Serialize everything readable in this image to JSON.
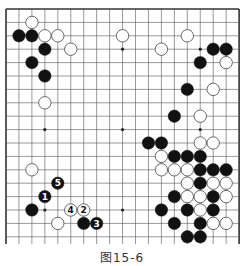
{
  "caption": "图15-6",
  "board": {
    "columns": 19,
    "rows_visible": 18,
    "origin_x": 6,
    "origin_y": 9,
    "spacing_x": 12.95,
    "spacing_y": 13.4,
    "edges": {
      "left": true,
      "top": true,
      "right": true,
      "bottom": false
    },
    "star_points": [
      [
        3,
        3
      ],
      [
        9,
        3
      ],
      [
        15,
        3
      ],
      [
        3,
        9
      ],
      [
        9,
        9
      ],
      [
        15,
        9
      ],
      [
        3,
        15
      ],
      [
        9,
        15
      ],
      [
        15,
        15
      ]
    ],
    "colors": {
      "line": "#555555",
      "edge": "#333333",
      "black": "#111111",
      "white": "#ffffff"
    }
  },
  "stones": [
    {
      "c": 2,
      "r": 1,
      "color": "white"
    },
    {
      "c": 1,
      "r": 2,
      "color": "black"
    },
    {
      "c": 2,
      "r": 2,
      "color": "black"
    },
    {
      "c": 3,
      "r": 2,
      "color": "white"
    },
    {
      "c": 4,
      "r": 2,
      "color": "white"
    },
    {
      "c": 9,
      "r": 2,
      "color": "white"
    },
    {
      "c": 14,
      "r": 2,
      "color": "white"
    },
    {
      "c": 3,
      "r": 3,
      "color": "black"
    },
    {
      "c": 5,
      "r": 3,
      "color": "white"
    },
    {
      "c": 12,
      "r": 3,
      "color": "white"
    },
    {
      "c": 16,
      "r": 3,
      "color": "black"
    },
    {
      "c": 17,
      "r": 3,
      "color": "black"
    },
    {
      "c": 2,
      "r": 4,
      "color": "black"
    },
    {
      "c": 15,
      "r": 4,
      "color": "black"
    },
    {
      "c": 17,
      "r": 4,
      "color": "white"
    },
    {
      "c": 3,
      "r": 5,
      "color": "black"
    },
    {
      "c": 14,
      "r": 6,
      "color": "black"
    },
    {
      "c": 16,
      "r": 6,
      "color": "white"
    },
    {
      "c": 3,
      "r": 7,
      "color": "white"
    },
    {
      "c": 13,
      "r": 8,
      "color": "black"
    },
    {
      "c": 15,
      "r": 8,
      "color": "white"
    },
    {
      "c": 11,
      "r": 10,
      "color": "black"
    },
    {
      "c": 12,
      "r": 10,
      "color": "black"
    },
    {
      "c": 15,
      "r": 10,
      "color": "white"
    },
    {
      "c": 16,
      "r": 10,
      "color": "white"
    },
    {
      "c": 12,
      "r": 11,
      "color": "white"
    },
    {
      "c": 13,
      "r": 11,
      "color": "black"
    },
    {
      "c": 14,
      "r": 11,
      "color": "black"
    },
    {
      "c": 15,
      "r": 11,
      "color": "black"
    },
    {
      "c": 12,
      "r": 12,
      "color": "white"
    },
    {
      "c": 13,
      "r": 12,
      "color": "white"
    },
    {
      "c": 14,
      "r": 12,
      "color": "white"
    },
    {
      "c": 15,
      "r": 12,
      "color": "black"
    },
    {
      "c": 16,
      "r": 12,
      "color": "black"
    },
    {
      "c": 17,
      "r": 12,
      "color": "black"
    },
    {
      "c": 2,
      "r": 12,
      "color": "white"
    },
    {
      "c": 14,
      "r": 13,
      "color": "white"
    },
    {
      "c": 15,
      "r": 13,
      "color": "black"
    },
    {
      "c": 16,
      "r": 13,
      "color": "white"
    },
    {
      "c": 17,
      "r": 13,
      "color": "white"
    },
    {
      "c": 4,
      "r": 13,
      "color": "black",
      "label": "5"
    },
    {
      "c": 3,
      "r": 14,
      "color": "black",
      "label": "1"
    },
    {
      "c": 13,
      "r": 14,
      "color": "black"
    },
    {
      "c": 14,
      "r": 14,
      "color": "white"
    },
    {
      "c": 15,
      "r": 14,
      "color": "white"
    },
    {
      "c": 16,
      "r": 14,
      "color": "black"
    },
    {
      "c": 17,
      "r": 14,
      "color": "white"
    },
    {
      "c": 2,
      "r": 15,
      "color": "black"
    },
    {
      "c": 5,
      "r": 15,
      "color": "white",
      "label": "4"
    },
    {
      "c": 6,
      "r": 15,
      "color": "white",
      "label": "2"
    },
    {
      "c": 12,
      "r": 15,
      "color": "black"
    },
    {
      "c": 14,
      "r": 15,
      "color": "black"
    },
    {
      "c": 15,
      "r": 15,
      "color": "white"
    },
    {
      "c": 16,
      "r": 15,
      "color": "black"
    },
    {
      "c": 4,
      "r": 16,
      "color": "white"
    },
    {
      "c": 6,
      "r": 16,
      "color": "black"
    },
    {
      "c": 7,
      "r": 16,
      "color": "black",
      "label": "3"
    },
    {
      "c": 13,
      "r": 16,
      "color": "black"
    },
    {
      "c": 15,
      "r": 16,
      "color": "black"
    },
    {
      "c": 16,
      "r": 16,
      "color": "white"
    },
    {
      "c": 17,
      "r": 16,
      "color": "white"
    },
    {
      "c": 14,
      "r": 17,
      "color": "black"
    },
    {
      "c": 15,
      "r": 17,
      "color": "black"
    }
  ]
}
